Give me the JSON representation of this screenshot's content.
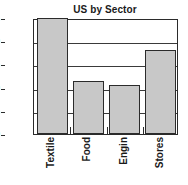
{
  "chart_data": {
    "type": "bar",
    "title": "US by Sector",
    "xlabel": "",
    "ylabel": "",
    "categories": [
      "Textile",
      "Food",
      "Engin",
      "Stores"
    ],
    "values": [
      2.5,
      1.15,
      1.05,
      1.8
    ],
    "ylim": [
      0.0,
      2.5
    ],
    "ytick_labels": [
      "0.0",
      "0.5",
      "1.0",
      "1.5",
      "2.0",
      "2.5"
    ],
    "ytick_values": [
      0.0,
      0.5,
      1.0,
      1.5,
      2.0,
      2.5
    ],
    "grid": true,
    "legend": "none",
    "bar_fill_color": "#c8c8c8",
    "bar_border_color": "#2b2b2b",
    "axis_color": "#2b2b2b",
    "background_color": "#ffffff"
  }
}
